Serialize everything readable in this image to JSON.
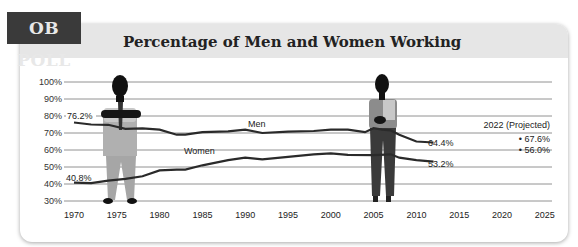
{
  "tag": {
    "label": "OB POLL"
  },
  "header": {
    "title": "Percentage of Men and Women Working"
  },
  "colors": {
    "tag_bg": "#3a3a3a",
    "header_bg": "#e6e6e6",
    "line": "#2a2a2a",
    "grid": "#777777"
  },
  "chart_data": {
    "type": "line",
    "title": "Percentage of Men and Women Working",
    "xlabel": "",
    "ylabel": "",
    "x_ticks": [
      "1970",
      "1975",
      "1980",
      "1985",
      "1990",
      "1995",
      "2000",
      "2005",
      "2010",
      "2015",
      "2020",
      "2025"
    ],
    "y_ticks": [
      "30%",
      "40%",
      "50%",
      "60%",
      "70%",
      "80%",
      "90%",
      "100%"
    ],
    "xlim": [
      1970,
      2025
    ],
    "ylim": [
      30,
      100
    ],
    "grid": true,
    "series": [
      {
        "name": "Men",
        "label": "Men",
        "x": [
          1970,
          1972,
          1974,
          1976,
          1978,
          1980,
          1982,
          1983,
          1985,
          1988,
          1990,
          1992,
          1995,
          1998,
          2000,
          2002,
          2004,
          2005,
          2006,
          2007,
          2008,
          2010,
          2012
        ],
        "values": [
          76.2,
          75.0,
          74.8,
          72.5,
          72.7,
          72.0,
          69.0,
          69.0,
          70.5,
          71.0,
          72.0,
          70.0,
          70.8,
          71.2,
          72.0,
          72.0,
          70.5,
          72.8,
          72.0,
          71.5,
          69.0,
          65.0,
          64.4
        ],
        "start_label": "76.2%",
        "end_label": "64.4%"
      },
      {
        "name": "Women",
        "label": "Women",
        "x": [
          1970,
          1972,
          1974,
          1976,
          1978,
          1980,
          1982,
          1983,
          1985,
          1988,
          1990,
          1992,
          1995,
          1998,
          2000,
          2002,
          2005,
          2007,
          2008,
          2010,
          2012
        ],
        "values": [
          40.8,
          40.5,
          42.0,
          43.0,
          44.5,
          48.0,
          48.5,
          48.5,
          51.0,
          54.0,
          55.5,
          54.5,
          56.0,
          57.5,
          58.0,
          57.2,
          57.0,
          57.5,
          55.5,
          54.0,
          53.2
        ],
        "start_label": "40.8%",
        "end_label": "53.2%"
      }
    ],
    "annotations": [
      {
        "text": "2022 (Projected)"
      },
      {
        "text": "67.6%",
        "series": "Men",
        "year": 2022,
        "value": 67.6
      },
      {
        "text": "56.0%",
        "series": "Women",
        "year": 2022,
        "value": 56.0
      }
    ]
  }
}
